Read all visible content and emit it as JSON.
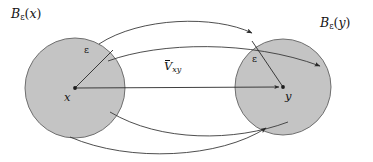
{
  "figure": {
    "background_color": "#ffffff",
    "width": 373,
    "height": 162
  },
  "style": {
    "ball_fill": "#c4c4c4",
    "ball_stroke": "#6b6b6b",
    "line_color": "#2a2a2a",
    "text_color": "#141414"
  },
  "labels": {
    "ball_x": {
      "base": "B",
      "sub": "ε",
      "arg": "(x)"
    },
    "ball_y": {
      "base": "B",
      "sub": "ε",
      "arg": "(y)"
    },
    "radius_x": "ε",
    "radius_y": "ε",
    "point_x": "x",
    "point_y": "y",
    "vector_xy": {
      "base": "V",
      "sub": "xy"
    }
  },
  "geometry": {
    "ball_x": {
      "cx": 75,
      "cy": 88,
      "r": 50
    },
    "ball_y": {
      "cx": 283,
      "cy": 87,
      "r": 48
    },
    "vector_arrow": {
      "x1": 75,
      "y1": 88,
      "x2": 280,
      "y2": 87
    },
    "radius_x_line": {
      "x1": 75,
      "y1": 88,
      "x2": 112,
      "y2": 51
    },
    "radius_y_line": {
      "x1": 283,
      "y1": 87,
      "x2": 253,
      "y2": 42
    },
    "curve_count": 4
  }
}
